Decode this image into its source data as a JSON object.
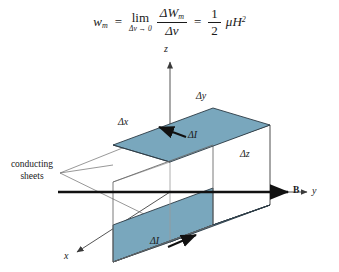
{
  "equation": {
    "lhs_var": "w",
    "lhs_sub": "m",
    "equals": "=",
    "lim_word": "lim",
    "lim_condition": "Δv → 0",
    "numerator_delta": "Δ",
    "numerator_var": "W",
    "numerator_sub": "m",
    "denominator_delta": "Δ",
    "denominator_var": "v",
    "equals2": "=",
    "half_num": "1",
    "half_den": "2",
    "mu": "μ",
    "field_var": "H",
    "field_exp": "2"
  },
  "figure": {
    "axes": {
      "z_label": "z",
      "y_label": "y",
      "x_label": "x"
    },
    "field_label": "B",
    "dimensions": {
      "dx": "Δx",
      "dy": "Δy",
      "dz": "Δz"
    },
    "current_top": "ΔI",
    "current_bottom": "ΔI",
    "callout_line1": "conducting",
    "callout_line2": "sheets",
    "colors": {
      "sheet_fill": "#79a7bd",
      "sheet_stroke": "#2b3a44",
      "line": "#4a4a4a",
      "axis": "#555555",
      "field_arrow": "#111111",
      "text": "#1a1a1a"
    }
  }
}
